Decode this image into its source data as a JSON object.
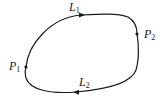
{
  "diagram": {
    "type": "closed-curve",
    "stroke_color": "#1a1a1a",
    "background": "#ffffff",
    "points": [
      {
        "id": "P1",
        "label": "P",
        "subscript": "1",
        "x": 26,
        "y": 67
      },
      {
        "id": "P2",
        "label": "P",
        "subscript": "2",
        "x": 137,
        "y": 34
      }
    ],
    "paths": [
      {
        "id": "L1",
        "label": "L",
        "subscript": "1",
        "from": "P1",
        "to": "P2",
        "direction": "clockwise-top",
        "arrow": "right"
      },
      {
        "id": "L2",
        "label": "L",
        "subscript": "2",
        "from": "P2",
        "to": "P1",
        "direction": "clockwise-bottom",
        "arrow": "left"
      }
    ]
  }
}
